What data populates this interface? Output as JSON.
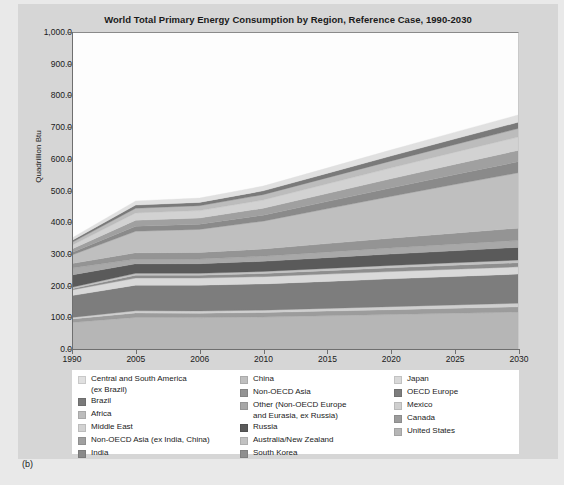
{
  "figure": {
    "panel_caption": "(b)"
  },
  "chart_data": {
    "type": "area",
    "stacked": true,
    "title": "World Total Primary Energy Consumption by Region, Reference Case, 1990-2030",
    "xlabel": "",
    "ylabel": "Quadrillion Btu",
    "ylim": [
      0,
      1000
    ],
    "ytick_labels": [
      "0.0",
      "100.0",
      "200.0",
      "300.0",
      "400.0",
      "500.0",
      "600.0",
      "700.0",
      "800.0",
      "900.0",
      "1,000.0"
    ],
    "ytick_values": [
      0,
      100,
      200,
      300,
      400,
      500,
      600,
      700,
      800,
      900,
      1000
    ],
    "grid": false,
    "legend_position": "below",
    "categories": [
      "1990",
      "2005",
      "2006",
      "2010",
      "2015",
      "2020",
      "2025",
      "2030"
    ],
    "x": [
      1990,
      2005,
      2006,
      2010,
      2015,
      2020,
      2025,
      2030
    ],
    "series": [
      {
        "name": "United States",
        "color": "#b6b6b6",
        "values": [
          84.0,
          100.0,
          99.5,
          101.0,
          105.0,
          109.0,
          113.0,
          117.0
        ]
      },
      {
        "name": "Canada",
        "color": "#9c9c9c",
        "values": [
          11.0,
          14.0,
          14.0,
          14.5,
          15.0,
          15.5,
          16.0,
          16.5
        ]
      },
      {
        "name": "Mexico",
        "color": "#cfcfcf",
        "values": [
          5.0,
          7.0,
          7.0,
          7.5,
          8.5,
          9.5,
          10.5,
          11.5
        ]
      },
      {
        "name": "OECD Europe",
        "color": "#7d7d7d",
        "values": [
          69.0,
          81.0,
          81.5,
          83.0,
          85.5,
          88.0,
          90.0,
          92.0
        ]
      },
      {
        "name": "Japan",
        "color": "#d9d9d9",
        "values": [
          18.0,
          22.5,
          22.5,
          23.0,
          23.0,
          23.0,
          23.0,
          23.0
        ]
      },
      {
        "name": "South Korea",
        "color": "#8e8e8e",
        "values": [
          4.0,
          9.0,
          9.0,
          10.0,
          11.0,
          12.0,
          12.5,
          13.0
        ]
      },
      {
        "name": "Australia/New Zealand",
        "color": "#c2c2c2",
        "values": [
          4.5,
          6.0,
          6.0,
          6.5,
          7.0,
          7.5,
          8.0,
          8.5
        ]
      },
      {
        "name": "Russia",
        "color": "#5a5a5a",
        "values": [
          39.0,
          30.0,
          30.5,
          32.0,
          34.0,
          36.0,
          38.0,
          40.0
        ]
      },
      {
        "name": "Other (Non-OECD Europe\nand Eurasia, ex Russia)",
        "color": "#a8a8a8",
        "values": [
          22.0,
          15.0,
          15.0,
          16.0,
          17.5,
          19.0,
          20.5,
          22.0
        ]
      },
      {
        "name": "Non-OECD Asia",
        "color": "#949494",
        "values": [
          14.0,
          20.0,
          20.5,
          23.0,
          27.0,
          31.0,
          35.0,
          39.0
        ]
      },
      {
        "name": "China",
        "color": "#bfbfbf",
        "values": [
          27.0,
          68.0,
          73.0,
          88.0,
          110.0,
          132.0,
          154.0,
          175.0
        ]
      },
      {
        "name": "India",
        "color": "#8a8a8a",
        "values": [
          8.0,
          16.0,
          16.5,
          19.0,
          23.0,
          27.0,
          31.0,
          35.0
        ]
      },
      {
        "name": "Non-OECD Asia (ex India, China)",
        "color": "#a0a0a0",
        "values": [
          11.0,
          19.0,
          19.5,
          22.0,
          25.5,
          29.0,
          32.5,
          36.0
        ]
      },
      {
        "name": "Middle East",
        "color": "#d2d2d2",
        "values": [
          12.0,
          23.0,
          23.5,
          26.0,
          30.0,
          34.0,
          38.0,
          42.0
        ]
      },
      {
        "name": "Africa",
        "color": "#bcbcbc",
        "values": [
          9.0,
          15.0,
          15.5,
          17.0,
          19.5,
          22.0,
          24.5,
          27.0
        ]
      },
      {
        "name": "Brazil",
        "color": "#7a7a7a",
        "values": [
          6.0,
          10.0,
          10.5,
          12.0,
          14.0,
          16.0,
          18.0,
          20.0
        ]
      },
      {
        "name": "Central and South America\n(ex Brazil)",
        "color": "#e0e0e0",
        "values": [
          8.0,
          13.0,
          13.5,
          15.0,
          17.0,
          19.0,
          21.0,
          23.0
        ]
      }
    ],
    "totals": [
      351.5,
      468.5,
      477.0,
      515.5,
      572.5,
      629.5,
      685.5,
      740.5
    ],
    "annotations": []
  },
  "legend": {
    "columns": [
      {
        "items": [
          {
            "label": "Central and South America\n(ex Brazil)",
            "color": "#e0e0e0"
          },
          {
            "label": "Brazil",
            "color": "#7a7a7a"
          },
          {
            "label": "Africa",
            "color": "#bcbcbc"
          },
          {
            "label": "Middle East",
            "color": "#d2d2d2"
          },
          {
            "label": "Non-OECD Asia (ex India, China)",
            "color": "#a0a0a0"
          },
          {
            "label": "India",
            "color": "#8a8a8a"
          }
        ]
      },
      {
        "items": [
          {
            "label": "China",
            "color": "#bfbfbf"
          },
          {
            "label": "Non-OECD Asia",
            "color": "#949494"
          },
          {
            "label": "Other (Non-OECD Europe\nand Eurasia, ex Russia)",
            "color": "#a8a8a8"
          },
          {
            "label": "Russia",
            "color": "#5a5a5a"
          },
          {
            "label": "Australia/New Zealand",
            "color": "#c2c2c2"
          },
          {
            "label": "South Korea",
            "color": "#8e8e8e"
          }
        ]
      },
      {
        "items": [
          {
            "label": "Japan",
            "color": "#d9d9d9"
          },
          {
            "label": "OECD Europe",
            "color": "#7d7d7d"
          },
          {
            "label": "Mexico",
            "color": "#cfcfcf"
          },
          {
            "label": "Canada",
            "color": "#9c9c9c"
          },
          {
            "label": "United States",
            "color": "#b6b6b6"
          }
        ]
      }
    ]
  }
}
